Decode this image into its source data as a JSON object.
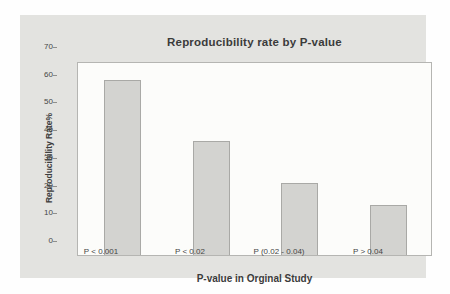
{
  "chart_data": {
    "type": "bar",
    "title": "Reproducibility rate by P-value",
    "categories": [
      "P < 0.001",
      "P < 0.02",
      "P (0.02 - 0.04)",
      "P > 0.04"
    ],
    "values": [
      63,
      41,
      26,
      18
    ],
    "xlabel": "P-value in Orginal Study",
    "ylabel": "Reproducibility Rate%",
    "ylim": [
      0,
      70
    ],
    "yticks": [
      0,
      10,
      20,
      30,
      40,
      50,
      60,
      70
    ],
    "grid": false,
    "legend": "none",
    "colors": {
      "panel_bg": "#e3e3e0",
      "plot_bg": "#fcfcfa",
      "plot_border": "#b5b5b2",
      "bar_fill": "#d3d3d0",
      "bar_border": "#a9a9a6",
      "title_text": "#3b3b3b",
      "tick_text": "#454545"
    }
  }
}
